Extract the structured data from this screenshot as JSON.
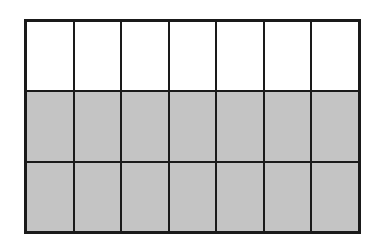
{
  "diagram": {
    "title": "",
    "rows": 3,
    "columns": 7,
    "shaded_rows": 2,
    "unshaded_rows": 1,
    "shaded_fraction": "14/21",
    "colors": {
      "shaded": "#c4c4c4",
      "unshaded": "#ffffff",
      "border": "#1a1a1a"
    },
    "cells": [
      [
        "white",
        "white",
        "white",
        "white",
        "white",
        "white",
        "white"
      ],
      [
        "gray",
        "gray",
        "gray",
        "gray",
        "gray",
        "gray",
        "gray"
      ],
      [
        "gray",
        "gray",
        "gray",
        "gray",
        "gray",
        "gray",
        "gray"
      ]
    ]
  }
}
